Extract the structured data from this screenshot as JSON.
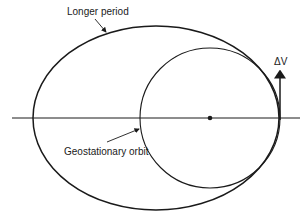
{
  "diagram": {
    "labels": {
      "longer_period": "Longer period",
      "geostationary_orbit": "Geostationary orbit",
      "delta_v": "ΔV"
    },
    "colors": {
      "stroke": "#1a1a1a",
      "background": "#ffffff"
    },
    "elements": {
      "ellipse": {
        "cx": 156,
        "cy": 118,
        "rx": 123,
        "ry": 92
      },
      "circle": {
        "cx": 210,
        "cy": 118,
        "r": 70
      },
      "axis_line": {
        "x1": 12,
        "x2": 300,
        "y": 118
      },
      "center_dot": {
        "cx": 210,
        "cy": 118
      },
      "delta_v_arrow": {
        "x": 280,
        "y1": 120,
        "y2": 72
      }
    }
  }
}
